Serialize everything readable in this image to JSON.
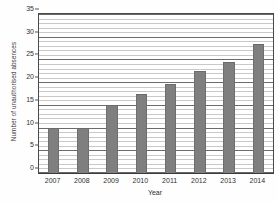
{
  "chart_data": {
    "type": "bar",
    "title": "Number of unauthorised absences",
    "title_visible": "",
    "xlabel": "Year",
    "ylabel": "Number of unauthorised absences",
    "categories": [
      "2007",
      "2008",
      "2009",
      "2010",
      "2011",
      "2012",
      "2013",
      "2014"
    ],
    "values": [
      10,
      10,
      15,
      17.5,
      19.5,
      22.5,
      24.5,
      28.5
    ],
    "ylim": [
      0,
      35
    ],
    "y_ticks": [
      "0",
      "5",
      "10",
      "15",
      "20",
      "25",
      "30",
      "35"
    ],
    "y_tick_values": [
      0,
      5,
      10,
      15,
      20,
      25,
      30,
      35
    ],
    "y_major_step": 5,
    "y_minor_step": 1,
    "grid": "horizontal",
    "legend": "none",
    "bar_color": "#7f7f7f",
    "gridline_major_color": "#6b6b6b",
    "gridline_minor_color": "#c9c9c9",
    "axis_color": "#4a4a4a",
    "plot_background": "#ffffff"
  }
}
